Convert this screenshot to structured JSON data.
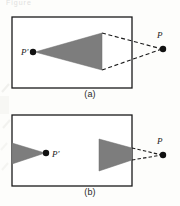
{
  "figure": {
    "title_fragment": "Figure",
    "panels": [
      {
        "id": "a",
        "caption": "(a)",
        "box": {
          "x": 12,
          "y": 17,
          "w": 120,
          "h": 71
        },
        "labels": {
          "source_point": "P",
          "image_point": "P'"
        },
        "points": [
          {
            "name": "image-point",
            "label": "P'",
            "x": 33,
            "y": 52,
            "r": 3.2,
            "inside_box": true
          },
          {
            "name": "source-point",
            "label": "P",
            "x": 163,
            "y": 49,
            "r": 3.2,
            "inside_box": false
          }
        ],
        "triangles": [
          {
            "name": "shaded-wedge",
            "points": "35,52 102,33 102,70",
            "fill": "#7d7d7d"
          }
        ],
        "dashed_lines": [
          {
            "from": [
              102,
              33
            ],
            "to": [
              162,
              49
            ]
          },
          {
            "from": [
              102,
              70
            ],
            "to": [
              162,
              49
            ]
          }
        ]
      },
      {
        "id": "b",
        "caption": "(b)",
        "box": {
          "x": 12,
          "y": 115,
          "w": 120,
          "h": 71
        },
        "labels": {
          "source_point": "P",
          "image_point": "P'"
        },
        "points": [
          {
            "name": "image-point",
            "label": "P'",
            "x": 46,
            "y": 153,
            "r": 3.2,
            "inside_box": true
          },
          {
            "name": "source-point",
            "label": "P",
            "x": 163,
            "y": 155,
            "r": 3.2,
            "inside_box": false
          }
        ],
        "triangles": [
          {
            "name": "shaded-wedge-left",
            "points": "12,143 12,164 45,153",
            "fill": "#7d7d7d"
          },
          {
            "name": "shaded-wedge-right",
            "points": "99,139 132,148 132,160 99,171",
            "fill": "#7d7d7d"
          }
        ],
        "dashed_lines": [
          {
            "from": [
              132,
              148
            ],
            "to": [
              162,
              155
            ]
          },
          {
            "from": [
              132,
              160
            ],
            "to": [
              162,
              155
            ]
          }
        ]
      }
    ],
    "colors": {
      "wedge_fill": "#7d7d7d",
      "stroke": "#1a1a1a",
      "point_fill": "#111111",
      "background": "#fdfdfb",
      "smudge": "#e8e8e4"
    }
  }
}
